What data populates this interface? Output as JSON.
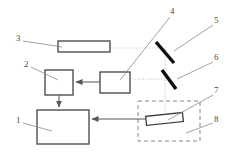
{
  "figure": {
    "type": "optical-system-block-diagram",
    "background_color": "#ffffff",
    "line_color": "#555555",
    "mirror_color": "#111111",
    "beam_color": "#b8b8b8",
    "leader_color": "#808080"
  },
  "labels": [
    {
      "id": "1",
      "text": "1",
      "x": 16,
      "y": 120,
      "target": "detector-unit"
    },
    {
      "id": "2",
      "text": "2",
      "x": 24,
      "y": 64,
      "target": "controller-box"
    },
    {
      "id": "3",
      "text": "3",
      "x": 16,
      "y": 38,
      "target": "laser-source"
    },
    {
      "id": "4",
      "text": "4",
      "x": 170,
      "y": 11,
      "target": "beam-conditioner-box"
    },
    {
      "id": "5",
      "text": "5",
      "x": 214,
      "y": 20,
      "target": "mirror-upper"
    },
    {
      "id": "6",
      "text": "6",
      "x": 214,
      "y": 57,
      "target": "mirror-lower"
    },
    {
      "id": "7",
      "text": "7",
      "x": 214,
      "y": 90,
      "target": "sample-slide"
    },
    {
      "id": "8",
      "text": "8",
      "x": 214,
      "y": 119,
      "target": "sample-chamber"
    }
  ],
  "components": [
    {
      "name": "laser-source",
      "ref": "3",
      "shape": "rectangle",
      "x": 58,
      "y": 41,
      "width": 52,
      "height": 11
    },
    {
      "name": "controller-box",
      "ref": "2",
      "shape": "square",
      "x": 45,
      "y": 70,
      "width": 28,
      "height": 25
    },
    {
      "name": "detector-unit",
      "ref": "1",
      "shape": "rectangle",
      "x": 37,
      "y": 110,
      "width": 52,
      "height": 34
    },
    {
      "name": "beam-conditioner-box",
      "ref": "4",
      "shape": "rectangle",
      "x": 100,
      "y": 72,
      "width": 30,
      "height": 21
    },
    {
      "name": "mirror-upper",
      "ref": "5",
      "shape": "mirror-bar",
      "x1": 156,
      "y1": 42,
      "x2": 174,
      "y2": 63
    },
    {
      "name": "mirror-lower",
      "ref": "6",
      "shape": "mirror-bar",
      "x1": 161,
      "y1": 70,
      "x2": 176,
      "y2": 89
    },
    {
      "name": "sample-slide",
      "ref": "7",
      "shape": "tilted-bar",
      "x": 146,
      "y": 115,
      "width": 36,
      "height": 9
    },
    {
      "name": "sample-chamber",
      "ref": "8",
      "shape": "dashed-rectangle",
      "x": 138,
      "y": 101,
      "width": 62,
      "height": 40
    }
  ],
  "connections": [
    {
      "name": "beam-laser-to-mirror-upper",
      "style": "dotted",
      "from": "laser-source",
      "to": "mirror-upper",
      "path": "horizontal"
    },
    {
      "name": "beam-mirror-upper-to-lower",
      "style": "dotted",
      "from": "mirror-upper",
      "to": "mirror-lower",
      "path": "vertical"
    },
    {
      "name": "beam-mirror-lower-to-box4",
      "style": "dotted",
      "from": "mirror-lower",
      "to": "beam-conditioner-box",
      "path": "horizontal"
    },
    {
      "name": "beam-mirror-lower-to-sample",
      "style": "dotted",
      "from": "mirror-lower",
      "to": "sample-slide",
      "path": "vertical"
    },
    {
      "name": "arrow-box4-to-controller",
      "style": "solid-arrow",
      "from": "beam-conditioner-box",
      "to": "controller-box",
      "direction": "left"
    },
    {
      "name": "arrow-controller-to-detector",
      "style": "solid-arrow",
      "from": "controller-box",
      "to": "detector-unit",
      "direction": "down"
    },
    {
      "name": "arrow-sample-to-detector",
      "style": "solid-arrow",
      "from": "sample-chamber",
      "to": "detector-unit",
      "direction": "left"
    }
  ]
}
